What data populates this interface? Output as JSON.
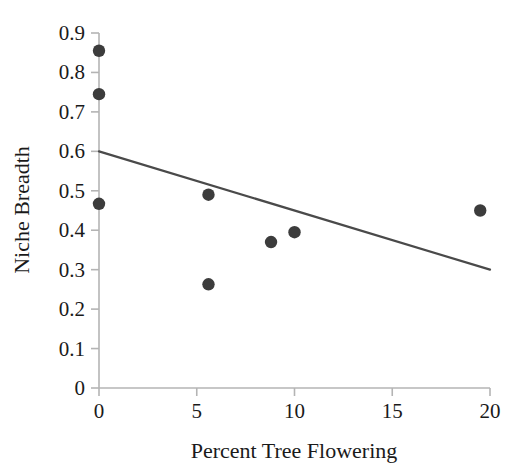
{
  "chart_data": {
    "type": "scatter",
    "title": "",
    "xlabel": "Percent Tree Flowering",
    "ylabel": "Niche Breadth",
    "xlim": [
      0,
      20
    ],
    "ylim": [
      0,
      0.9
    ],
    "grid": false,
    "legend": "none",
    "x_ticks": [
      0,
      5,
      10,
      15,
      20
    ],
    "x_tick_labels": [
      "0",
      "5",
      "10",
      "15",
      "20"
    ],
    "y_ticks": [
      0,
      0.1,
      0.2,
      0.3,
      0.4,
      0.5,
      0.6,
      0.7,
      0.8,
      0.9
    ],
    "y_tick_labels": [
      "0",
      "0.1",
      "0.2",
      "0.3",
      "0.4",
      "0.5",
      "0.6",
      "0.7",
      "0.8",
      "0.9"
    ],
    "series": [
      {
        "name": "observations",
        "marker": "filled-circle",
        "color": "#3c3c3c",
        "points": [
          {
            "x": 0.0,
            "y": 0.855
          },
          {
            "x": 0.0,
            "y": 0.745
          },
          {
            "x": 0.0,
            "y": 0.467
          },
          {
            "x": 5.6,
            "y": 0.49
          },
          {
            "x": 5.6,
            "y": 0.263
          },
          {
            "x": 8.8,
            "y": 0.37
          },
          {
            "x": 10.0,
            "y": 0.395
          },
          {
            "x": 19.5,
            "y": 0.45
          }
        ]
      }
    ],
    "trendline": {
      "name": "linear-fit",
      "color": "#4a4a4a",
      "x_start": 0.0,
      "y_start": 0.6,
      "x_end": 20.0,
      "y_end": 0.3
    },
    "colors": {
      "marker": "#3c3c3c",
      "trendline": "#4a4a4a",
      "axis": "#b4b4b4",
      "text": "#1a1a1a",
      "background": "#ffffff"
    }
  }
}
